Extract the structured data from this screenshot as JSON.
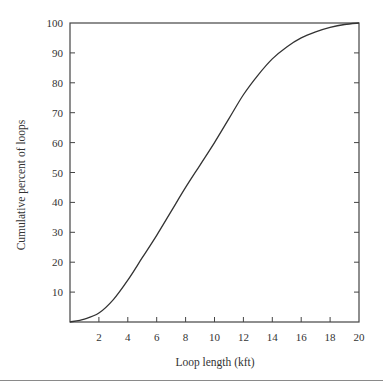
{
  "chart_data": {
    "type": "line",
    "title": "",
    "xlabel": "Loop length (kft)",
    "ylabel": "Cumulative percent of loops",
    "xlim": [
      0,
      20
    ],
    "ylim": [
      0,
      100
    ],
    "x_ticks": [
      2,
      4,
      6,
      8,
      10,
      12,
      14,
      16,
      18,
      20
    ],
    "y_ticks": [
      10,
      20,
      30,
      40,
      50,
      60,
      70,
      80,
      90,
      100
    ],
    "grid": false,
    "legend": null,
    "series": [
      {
        "name": "Cumulative distribution",
        "x": [
          0,
          1,
          2,
          3,
          4,
          5,
          6,
          7,
          8,
          9,
          10,
          11,
          12,
          13,
          14,
          15,
          16,
          17,
          18,
          19,
          20
        ],
        "y": [
          0,
          1,
          3,
          7.5,
          14,
          21.5,
          29,
          37,
          45,
          52.5,
          60,
          68,
          76,
          82.5,
          88,
          92,
          95,
          97,
          98.5,
          99.5,
          100
        ]
      }
    ],
    "line_color": "#333333"
  },
  "axes": {
    "x_label": "Loop length (kft)",
    "y_label": "Cumulative percent of loops"
  }
}
